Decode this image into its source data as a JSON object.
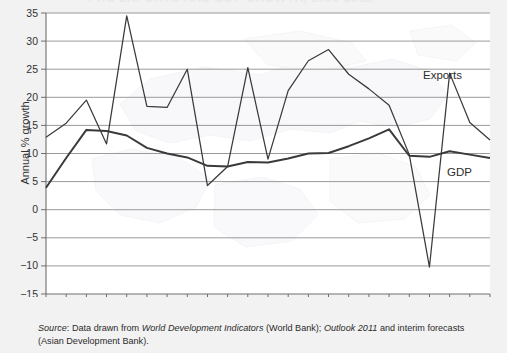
{
  "figure": {
    "title_clipped": "PRC EXPORTS AND GDP GROWTH, 1990-2012",
    "background_watermark": "faint-world-map"
  },
  "axes": {
    "y_title": "Annual % growth",
    "y_ticks": [
      35,
      30,
      25,
      20,
      15,
      10,
      5,
      0,
      -5,
      -10,
      -15
    ],
    "y_tick_labels": [
      "35",
      "30",
      "25",
      "20",
      "15",
      "10",
      "5",
      "0",
      "−5",
      "−10",
      "−15"
    ],
    "x_tick_labels": [
      "1990",
      "1992",
      "1994",
      "1996",
      "1998",
      "2000",
      "2002",
      "2004",
      "2006",
      "2008",
      "2010",
      "2012"
    ],
    "x_minor_step_years": 1
  },
  "annotations": {
    "exports_label": "Exports",
    "gdp_label": "GDP"
  },
  "source": {
    "prefix": "Source",
    "colon": ": ",
    "t1": "Data drawn from ",
    "italic1": "World Development Indicators",
    "t2": " (World Bank); ",
    "italic2": "Outlook 2011",
    "t3": " and interim forecasts (Asian Development Bank)."
  },
  "colors": {
    "page_background": "#f2f2f2",
    "plot_background": "#ffffff",
    "gridline": "#8c8c8c",
    "axis": "#6e6e6e",
    "series_line": "#3a3a3a",
    "text": "#2b2b2b"
  },
  "chart_data": {
    "type": "line",
    "title": "PRC Exports and GDP Growth",
    "xlabel": "",
    "ylabel": "Annual % growth",
    "xlim": [
      1990,
      2012
    ],
    "ylim": [
      -15,
      35
    ],
    "grid": true,
    "legend": "inline-annotations",
    "x": [
      1990,
      1991,
      1992,
      1993,
      1994,
      1995,
      1996,
      1997,
      1998,
      1999,
      2000,
      2001,
      2002,
      2003,
      2004,
      2005,
      2006,
      2007,
      2008,
      2009,
      2010,
      2011,
      2012
    ],
    "series": [
      {
        "name": "Exports",
        "values": [
          12.9,
          15.4,
          19.5,
          11.7,
          34.5,
          18.4,
          18.2,
          25.0,
          4.3,
          7.7,
          25.3,
          9.0,
          21.2,
          26.5,
          28.5,
          24.1,
          21.5,
          18.6,
          9.8,
          -10.2,
          24.3,
          15.5,
          12.4
        ]
      },
      {
        "name": "GDP",
        "values": [
          3.9,
          9.2,
          14.2,
          14.0,
          13.2,
          11.0,
          10.0,
          9.3,
          7.8,
          7.7,
          8.5,
          8.4,
          9.1,
          10.0,
          10.1,
          11.3,
          12.7,
          14.3,
          9.6,
          9.4,
          10.4,
          9.8,
          9.2
        ]
      }
    ]
  }
}
